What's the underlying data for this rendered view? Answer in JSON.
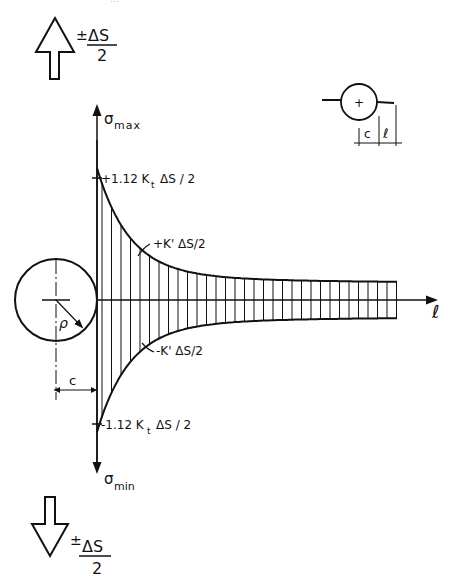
{
  "header": {
    "running_head": "…"
  },
  "load_top": {
    "sign": "±",
    "numerator": "ΔS",
    "denominator": "2"
  },
  "load_bottom": {
    "sign": "±",
    "numerator": "ΔS",
    "denominator": "2"
  },
  "axes": {
    "y_top_label": "σ",
    "y_top_sub": "max",
    "y_bottom_label": "σ",
    "y_bottom_sub": "min",
    "x_label": "ℓ"
  },
  "annotations": {
    "peak_top": "+1.12 K",
    "peak_top_sub": "t",
    "peak_top_tail": "ΔS / 2",
    "curve_top": "+K' ΔS/2",
    "peak_bottom": "-1.12 K",
    "peak_bottom_sub": "t",
    "peak_bottom_tail": "ΔS / 2",
    "curve_bottom": "-K' ΔS/2",
    "radius": "ρ",
    "distance_c": "c"
  },
  "inset": {
    "center_mark": "+",
    "dim_c": "c",
    "dim_l": "ℓ"
  },
  "colors": {
    "ink": "#111111",
    "background": "#ffffff"
  }
}
